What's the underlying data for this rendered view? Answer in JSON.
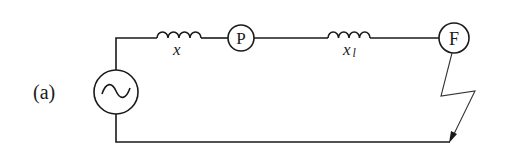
{
  "figure_label": "(a)",
  "components": {
    "source": {
      "symbol": "~",
      "type": "ac-source"
    },
    "inductor_1": {
      "label": "x",
      "type": "reactance"
    },
    "node_p": {
      "label": "P",
      "type": "node"
    },
    "inductor_2": {
      "label": "x",
      "subscript": "l",
      "type": "line-reactance"
    },
    "node_f": {
      "label": "F",
      "type": "fault-point"
    }
  },
  "colors": {
    "line": "#1a1a1a",
    "background": "#ffffff"
  }
}
